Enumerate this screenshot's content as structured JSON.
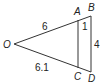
{
  "diagram": {
    "type": "similar-triangles",
    "colors": {
      "stroke": "#333333",
      "text": "#222222",
      "background": "#ffffff"
    },
    "points": {
      "O": {
        "label": "O",
        "x": 14,
        "y": 44
      },
      "A": {
        "label": "A",
        "x": 78,
        "y": 20
      },
      "B": {
        "label": "B",
        "x": 91,
        "y": 16
      },
      "C": {
        "label": "C",
        "x": 78,
        "y": 68
      },
      "D": {
        "label": "D",
        "x": 91,
        "y": 72
      }
    },
    "segments": [
      {
        "from": "O",
        "to": "B"
      },
      {
        "from": "O",
        "to": "D"
      },
      {
        "from": "A",
        "to": "C"
      },
      {
        "from": "B",
        "to": "D"
      }
    ],
    "measurements": {
      "OA": "6",
      "OC": "6.1",
      "AB": "1",
      "BD": "4"
    }
  }
}
